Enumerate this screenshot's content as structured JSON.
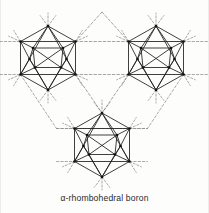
{
  "figure": {
    "caption": "α-rhombohedral boron",
    "title": "α-rhombohedral boron",
    "background_color": "#fdfdfc",
    "bond_color": "#1d1d1d",
    "dashed_bond_color": "#8d8d8d",
    "vertex_color": "#111111",
    "canvas": {
      "width": 209,
      "height": 213
    }
  },
  "structure": {
    "description": "Three B12 icosahedral clusters linked by dashed inter-icosahedral bonds",
    "cluster_count": 3,
    "vertices_per_cluster": 12,
    "clusters": [
      {
        "name": "icosahedron-top-left",
        "cx": 48,
        "cy": 58,
        "r": 32
      },
      {
        "name": "icosahedron-top-right",
        "cx": 156,
        "cy": 58,
        "r": 32
      },
      {
        "name": "icosahedron-bottom-center",
        "cx": 102,
        "cy": 145,
        "r": 32
      }
    ],
    "cluster_vertex_offsets": [
      {
        "id": "top",
        "dx": 0.0,
        "dy": -32.0
      },
      {
        "id": "upper-left",
        "dx": -27.5,
        "dy": -16.5
      },
      {
        "id": "upper-right",
        "dx": 27.5,
        "dy": -16.5
      },
      {
        "id": "lower-left",
        "dx": -27.5,
        "dy": 16.5
      },
      {
        "id": "lower-right",
        "dx": 27.5,
        "dy": 16.5
      },
      {
        "id": "bottom",
        "dx": 0.0,
        "dy": 32.0
      },
      {
        "id": "inner-up-left",
        "dx": -15.0,
        "dy": -10.0
      },
      {
        "id": "inner-up-right",
        "dx": 15.0,
        "dy": -10.0
      },
      {
        "id": "inner-low-left",
        "dx": -13.0,
        "dy": 9.5
      },
      {
        "id": "inner-low-right",
        "dx": 13.0,
        "dy": 9.5
      },
      {
        "id": "inner-mid-left",
        "dx": -18.5,
        "dy": 1.0
      },
      {
        "id": "inner-mid-right",
        "dx": 18.5,
        "dy": 1.0
      }
    ],
    "intercluster_bonds": [
      {
        "from": "icosahedron-top-left.lower-right",
        "to": "icosahedron-top-right.lower-left",
        "style": "dashed"
      },
      {
        "from": "icosahedron-top-left.lower-right",
        "to": "icosahedron-bottom-center.top",
        "style": "dashed"
      },
      {
        "from": "icosahedron-top-right.lower-left",
        "to": "icosahedron-bottom-center.top",
        "style": "dashed"
      },
      {
        "from": "icosahedron-top-left.upper-right",
        "to": "apex-top-center",
        "style": "dashed"
      },
      {
        "from": "icosahedron-top-right.upper-left",
        "to": "apex-top-center",
        "style": "dashed"
      },
      {
        "from": "icosahedron-top-left.upper-right",
        "to": "icosahedron-top-right.upper-left",
        "style": "dashed"
      }
    ],
    "apex_top_center": {
      "x": 102,
      "y": 12
    },
    "dangling_stub_length": 13
  }
}
